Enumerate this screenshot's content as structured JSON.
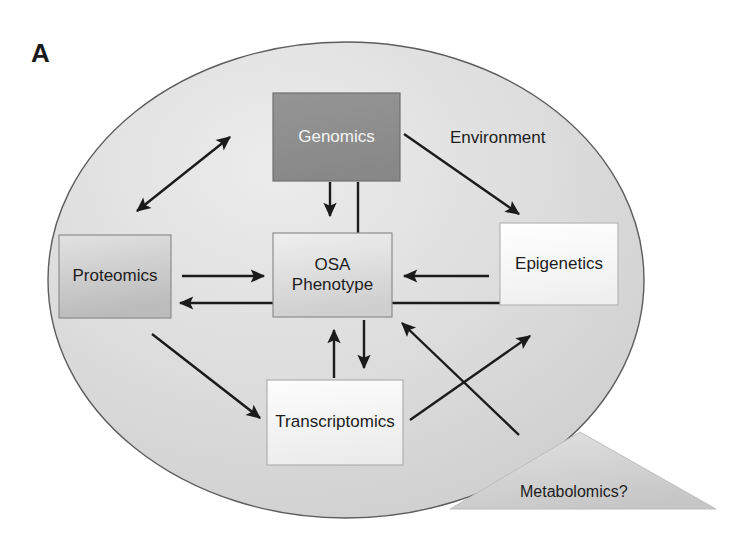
{
  "figure": {
    "panel_letter": "A",
    "container_label": "Environment",
    "nodes": [
      {
        "id": "genomics",
        "label": "Genomics",
        "shape": "rect",
        "fill": "#8e8e8e",
        "text_color": "#f4f4f4",
        "x": 273,
        "y": 93,
        "w": 127,
        "h": 88
      },
      {
        "id": "proteomics",
        "label": "Proteomics",
        "shape": "rect",
        "fill": "#c9c9c9",
        "text_color": "#1d1d1d",
        "x": 59,
        "y": 235,
        "w": 112,
        "h": 83
      },
      {
        "id": "osa-phenotype",
        "label": "OSA\nPhenotype",
        "shape": "rect",
        "fill": "#dedede",
        "text_color": "#1d1d1d",
        "x": 273,
        "y": 233,
        "w": 119,
        "h": 84
      },
      {
        "id": "epigenetics",
        "label": "Epigenetics",
        "shape": "rect",
        "fill": "#fafafa",
        "text_color": "#1d1d1d",
        "x": 500,
        "y": 223,
        "w": 118,
        "h": 82
      },
      {
        "id": "transcriptomics",
        "label": "Transcriptomics",
        "shape": "rect",
        "fill": "#f7f7f7",
        "text_color": "#1d1d1d",
        "x": 267,
        "y": 380,
        "w": 136,
        "h": 85
      },
      {
        "id": "metabolomics",
        "label": "Metabolomics?",
        "shape": "triangle",
        "fill": "#d2d2d2",
        "text_color": "#1d1d1d",
        "x": 450,
        "y": 432,
        "w": 266,
        "h": 77
      }
    ],
    "ellipse": {
      "cx": 346,
      "cy": 280,
      "rx": 298,
      "ry": 238,
      "fill": "#d8d8d8",
      "stroke": "#5a5a5a"
    },
    "edges": [
      {
        "id": "proteomics-genomics",
        "from": "proteomics",
        "to": "genomics",
        "heads": "both"
      },
      {
        "id": "genomics-epigenetics",
        "from": "genomics",
        "to": "epigenetics",
        "heads": "end"
      },
      {
        "id": "genomics-osa-arrow",
        "from": "genomics",
        "to": "osa-phenotype",
        "heads": "end"
      },
      {
        "id": "genomics-osa-line",
        "from": "genomics",
        "to": "osa-phenotype",
        "heads": "none"
      },
      {
        "id": "proteomics-osa",
        "from": "proteomics",
        "to": "osa-phenotype",
        "heads": "end"
      },
      {
        "id": "epigenetics-osa",
        "from": "epigenetics",
        "to": "osa-phenotype",
        "heads": "end"
      },
      {
        "id": "epigenetics-proteomics",
        "from": "epigenetics",
        "to": "proteomics",
        "heads": "end"
      },
      {
        "id": "proteomics-transcriptomics",
        "from": "proteomics",
        "to": "transcriptomics",
        "heads": "end"
      },
      {
        "id": "transcriptomics-osa",
        "from": "transcriptomics",
        "to": "osa-phenotype",
        "heads": "end"
      },
      {
        "id": "osa-transcriptomics",
        "from": "osa-phenotype",
        "to": "transcriptomics",
        "heads": "end"
      },
      {
        "id": "metabolomics-osa",
        "from": "metabolomics",
        "to": "osa-phenotype",
        "heads": "end"
      },
      {
        "id": "transcriptomics-metabolomics",
        "from": "transcriptomics",
        "to": "metabolomics",
        "heads": "end"
      }
    ]
  }
}
